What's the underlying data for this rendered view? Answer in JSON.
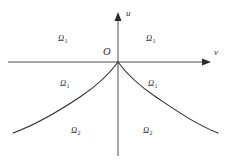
{
  "figure": {
    "background_color": "#ffffff",
    "line_color": "#2a2a2a",
    "width": 231,
    "height": 163
  },
  "axes": {
    "vertical": {
      "name": "u-axis",
      "label": "u",
      "arrow": "up",
      "x": 118,
      "y_top": 14,
      "y_bottom": 156
    },
    "horizontal": {
      "name": "v-axis",
      "label": "v",
      "arrow": "right",
      "y": 62,
      "x_left": 8,
      "x_right": 210
    },
    "origin": {
      "label": "O",
      "x": 118,
      "y": 62
    }
  },
  "curves": [
    {
      "name": "left-cusp-curve",
      "description": "Decaying curve from origin cusp to lower-left",
      "from": [
        118,
        62
      ],
      "to": [
        13,
        133
      ]
    },
    {
      "name": "right-cusp-curve",
      "description": "Decaying curve from origin cusp to lower-right",
      "from": [
        118,
        62
      ],
      "to": [
        218,
        133
      ]
    }
  ],
  "regions": [
    {
      "id": "r1-left",
      "symbol": "Ω",
      "subscript": "1",
      "quadrant": "upper-left"
    },
    {
      "id": "r1-right",
      "symbol": "Ω",
      "subscript": "1",
      "quadrant": "upper-right"
    },
    {
      "id": "r3-left",
      "symbol": "Ω",
      "subscript": "1",
      "quadrant": "middle-left"
    },
    {
      "id": "r3-right",
      "symbol": "Ω",
      "subscript": "1",
      "quadrant": "middle-right"
    },
    {
      "id": "r2-left",
      "symbol": "Ω",
      "subscript": "2",
      "quadrant": "lower-left"
    },
    {
      "id": "r2-right",
      "symbol": "Ω",
      "subscript": "2",
      "quadrant": "lower-right"
    }
  ]
}
